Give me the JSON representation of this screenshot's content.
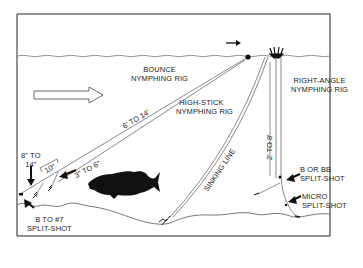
{
  "diagram": {
    "colors": {
      "ink": "#1a1a1a",
      "line": "#555555",
      "border": "#222222",
      "background": "#ffffff"
    },
    "labels": {
      "bounce": [
        "BOUNCE",
        "NYMPHING RIG"
      ],
      "right_angle": [
        "RIGHT-ANGLE",
        "NYMPHING RIG"
      ],
      "high_stick": [
        "HIGH-STICK",
        "NYMPHING RIG"
      ],
      "sinking_line": "SINKING LINE",
      "leader_length": "6' TO 14'",
      "two_to_eight": "2' TO 8'",
      "ten_inch": "10\"",
      "three_to_six": "3\" TO 6\"",
      "eight_to_fourteen": [
        "8\" TO",
        "14\""
      ],
      "b_to_7": [
        "B TO #7",
        "SPLIT-SHOT"
      ],
      "b_or_bb": [
        "B OR BB",
        "SPLIT-SHOT"
      ],
      "micro": [
        "MICRO",
        "SPLIT-SHOT"
      ]
    },
    "icons": [
      "current-direction-arrow-icon",
      "trout-silhouette-icon",
      "strike-indicator-icon",
      "nymph-fly-icon",
      "split-shot-icon",
      "pointer-arrow-icon"
    ]
  }
}
